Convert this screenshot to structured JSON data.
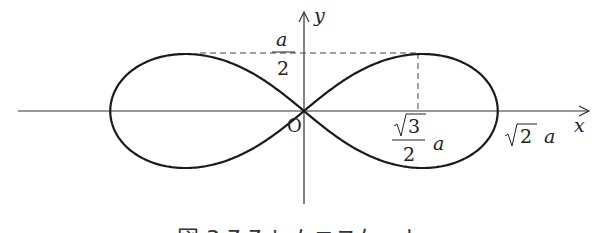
{
  "figure": {
    "caption": "図 3.7.7  レムニスケート",
    "curve_name": "lemniscate",
    "equation": "(x^2+y^2)^2 = 2a^2(x^2 - y^2)",
    "axes": {
      "x_label": "x",
      "y_label": "y",
      "origin_label": "O"
    },
    "labels": {
      "y_max": {
        "numerator": "a",
        "denominator": "2"
      },
      "x_at_max": {
        "radical": "3",
        "denominator": "2",
        "suffix": "a"
      },
      "x_intercept": {
        "radical": "2",
        "suffix": "a"
      }
    },
    "colors": {
      "curve": "#1a1a1a",
      "axis": "#333333",
      "dash": "#444444"
    }
  }
}
